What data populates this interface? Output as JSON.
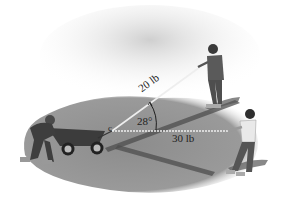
{
  "figure": {
    "forces": [
      {
        "label": "20 lb",
        "direction": "up-right toward girl"
      },
      {
        "label": "30 lb",
        "direction": "right toward boy"
      }
    ],
    "angle_label": "28°",
    "point_label": "c"
  },
  "colors": {
    "ground": "#8a8a8a",
    "ground_dark": "#5e5e5e",
    "sky": "#d9d9d9",
    "rope": "#e8e8e8",
    "figure": "#555555"
  }
}
